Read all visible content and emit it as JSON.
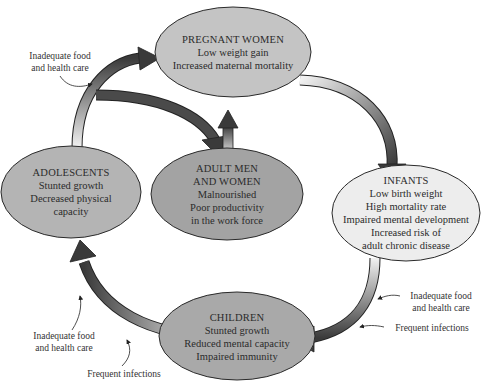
{
  "nodes": {
    "pregnant": {
      "title": "PREGNANT WOMEN",
      "lines": [
        "Low weight gain",
        "Increased maternal mortality"
      ],
      "fill": "#c4c4c4"
    },
    "infants": {
      "title": "INFANTS",
      "lines": [
        "Low birth weight",
        "High mortality rate",
        "Impaired mental development",
        "Increased risk of",
        "adult chronic disease"
      ],
      "fill": "#ededed"
    },
    "children": {
      "title": "CHILDREN",
      "lines": [
        "Stunted growth",
        "Reduced mental capacity",
        "Impaired immunity"
      ],
      "fill": "#a9a9a9"
    },
    "adolescents": {
      "title": "ADOLESCENTS",
      "lines": [
        "Stunted growth",
        "Decreased physical",
        "capacity"
      ],
      "fill": "#b4b4b4"
    },
    "adults": {
      "title_lines": [
        "ADULT MEN",
        "AND WOMEN"
      ],
      "lines": [
        "Malnourished",
        "Poor productivity",
        "in the work force"
      ],
      "fill": "#a3a3a3"
    }
  },
  "annotations": {
    "top_left": [
      "Inadequate food",
      "and health care"
    ],
    "right_food": [
      "Inadequate food",
      "and health care"
    ],
    "right_infections": "Frequent infections",
    "bottom_left_food": [
      "Inadequate food",
      "and health care"
    ],
    "bottom_left_infections": "Frequent infections"
  },
  "colors": {
    "arrow_dark": "#3c3c3c",
    "arrow_light": "#f0f0f0",
    "outline": "#2a2a2a"
  }
}
